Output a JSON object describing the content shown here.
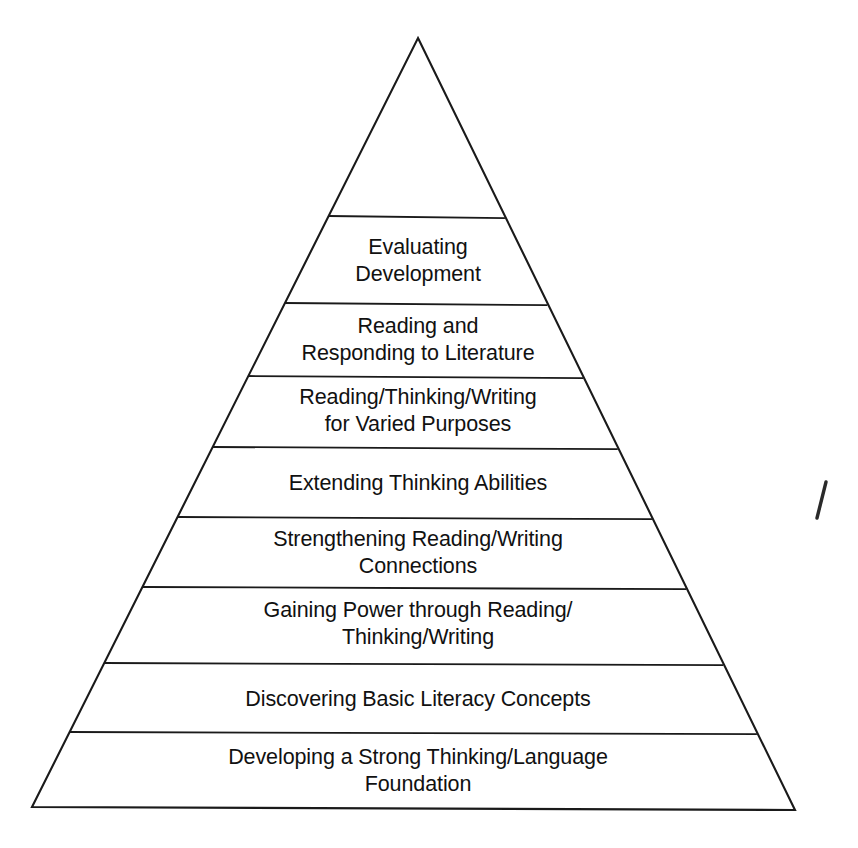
{
  "diagram": {
    "type": "pyramid",
    "title": "",
    "orientation": "bottom-to-top-hierarchy",
    "level_count": 8,
    "stroke_color": "#1a1a1a",
    "fill_color": "#ffffff",
    "background_color": "#ffffff",
    "text_color": "#111111",
    "geometry": {
      "apex_x": 418,
      "apex_y": 38,
      "base_left_x": 32,
      "base_left_y": 807,
      "base_right_x": 795,
      "base_right_y": 810,
      "divider_y": [
        216,
        303,
        376,
        447,
        517,
        587,
        663,
        732
      ]
    },
    "levels": [
      {
        "index": 8,
        "position": "top",
        "label": "Evaluating\nDevelopment",
        "center_x": 418,
        "center_y": 261,
        "top_y": 216,
        "bottom_y": 303
      },
      {
        "index": 7,
        "position": "second",
        "label": "Reading and\nResponding to Literature",
        "center_x": 418,
        "center_y": 340,
        "top_y": 303,
        "bottom_y": 376
      },
      {
        "index": 6,
        "position": "third",
        "label": "Reading/Thinking/Writing\nfor Varied Purposes",
        "center_x": 418,
        "center_y": 411,
        "top_y": 376,
        "bottom_y": 447
      },
      {
        "index": 5,
        "position": "fourth",
        "label": "Extending Thinking Abilities",
        "center_x": 418,
        "center_y": 483,
        "top_y": 447,
        "bottom_y": 517
      },
      {
        "index": 4,
        "position": "fifth",
        "label": "Strengthening Reading/Writing\nConnections",
        "center_x": 418,
        "center_y": 553,
        "top_y": 517,
        "bottom_y": 587
      },
      {
        "index": 3,
        "position": "sixth",
        "label": "Gaining Power through Reading/\nThinking/Writing",
        "center_x": 418,
        "center_y": 624,
        "top_y": 587,
        "bottom_y": 663
      },
      {
        "index": 2,
        "position": "seventh",
        "label": "Discovering Basic Literacy Concepts",
        "center_x": 418,
        "center_y": 699,
        "top_y": 663,
        "bottom_y": 732
      },
      {
        "index": 1,
        "position": "base",
        "label": "Developing a Strong Thinking/Language Foundation",
        "center_x": 418,
        "center_y": 771,
        "top_y": 732,
        "bottom_y": 808
      }
    ],
    "artifacts": [
      {
        "name": "scan-tick-mark",
        "x1": 826,
        "y1": 482,
        "x2": 817,
        "y2": 518
      }
    ]
  }
}
